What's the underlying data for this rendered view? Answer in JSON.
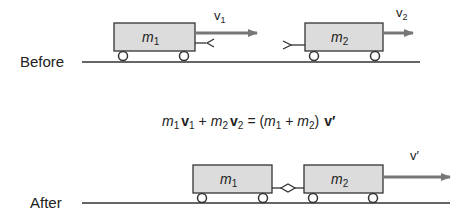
{
  "before": {
    "label": "Before",
    "cart1": {
      "mass": "m",
      "sub": "1",
      "velocity": "v",
      "vsub": "1"
    },
    "cart2": {
      "mass": "m",
      "sub": "2",
      "velocity": "v",
      "vsub": "2"
    }
  },
  "equation": {
    "m1": "m",
    "s1": "1",
    "v1": "v",
    "sv1": "1",
    "plus1": "+",
    "m2": "m",
    "s2": "2",
    "v2": "v",
    "sv2": "2",
    "eq": "= (",
    "m3": "m",
    "s3": "1",
    "plus2": " + ",
    "m4": "m",
    "s4": "2",
    "close": ")",
    "vprime": "v′"
  },
  "after": {
    "label": "After",
    "cart1": {
      "mass": "m",
      "sub": "1"
    },
    "cart2": {
      "mass": "m",
      "sub": "2"
    },
    "velocity": "v′"
  },
  "colors": {
    "cart_fill": "#dcdcdc",
    "stroke": "#333333",
    "arrow": "#777777",
    "text": "#222222"
  }
}
